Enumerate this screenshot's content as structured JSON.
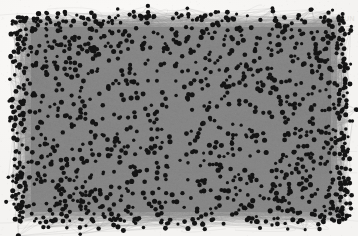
{
  "figure": {
    "kind": "network-graph",
    "background_color": "#f5f4f2",
    "node_color": "#141414",
    "edge_color": "#8a8a8a",
    "edge_color_dense": "#808080",
    "plot_bounds": {
      "x": 17,
      "y": 17,
      "width": 328,
      "height": 205
    }
  },
  "ghost_artifacts": {
    "top_right_line_1": "UN",
    "top_right_line_2": "ST",
    "top_line": "",
    "bottom_line": ""
  },
  "chart_data": {
    "type": "scatter",
    "title": "",
    "subtitle": "",
    "xlabel": "",
    "ylabel": "",
    "legend": [],
    "grid": false,
    "axis_visible": false,
    "tick_labels_x": [],
    "tick_labels_y": [],
    "xlim": [
      0,
      1
    ],
    "ylim": [
      0,
      1
    ],
    "graph": {
      "layout": "force-directed",
      "node_count": 1500,
      "edge_count": 6200,
      "node_radius_px": 1.9,
      "edge_width_px": 0.35,
      "node_color": "#141414",
      "edge_color": "#8a8a8a",
      "directed": false,
      "boundary_node_ratio": 0.22,
      "core_saturation": "fully-saturated"
    }
  }
}
